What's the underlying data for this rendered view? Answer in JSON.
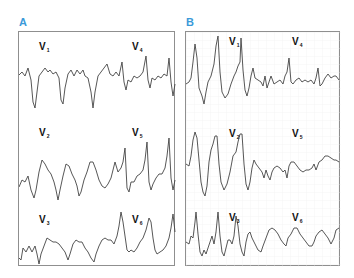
{
  "colors": {
    "label": "#3a9ad9",
    "trace": "#444444",
    "border": "#8f8f8f",
    "grid": "#ececec"
  },
  "panels": [
    {
      "id": "A",
      "label": "A",
      "grid": false,
      "leads": [
        {
          "name": "V",
          "sub": "1",
          "x": 33,
          "y": 14
        },
        {
          "name": "V",
          "sub": "4",
          "x": 114,
          "y": 14
        },
        {
          "name": "V",
          "sub": "2",
          "x": 33,
          "y": 97
        },
        {
          "name": "V",
          "sub": "5",
          "x": 112,
          "y": 97
        },
        {
          "name": "V",
          "sub": "3",
          "x": 33,
          "y": 179
        },
        {
          "name": "V",
          "sub": "6",
          "x": 112,
          "y": 179
        }
      ]
    },
    {
      "id": "B",
      "label": "B",
      "grid": true,
      "leads": [
        {
          "name": "V",
          "sub": "1",
          "x": 32,
          "y": 3
        },
        {
          "name": "V",
          "sub": "4",
          "x": 104,
          "y": 3
        },
        {
          "name": "V",
          "sub": "2",
          "x": 38,
          "y": 83
        },
        {
          "name": "V",
          "sub": "5",
          "x": 104,
          "y": 83
        },
        {
          "name": "V",
          "sub": "3",
          "x": 38,
          "y": 164
        },
        {
          "name": "V",
          "sub": "6",
          "x": 104,
          "y": 164
        }
      ]
    }
  ]
}
